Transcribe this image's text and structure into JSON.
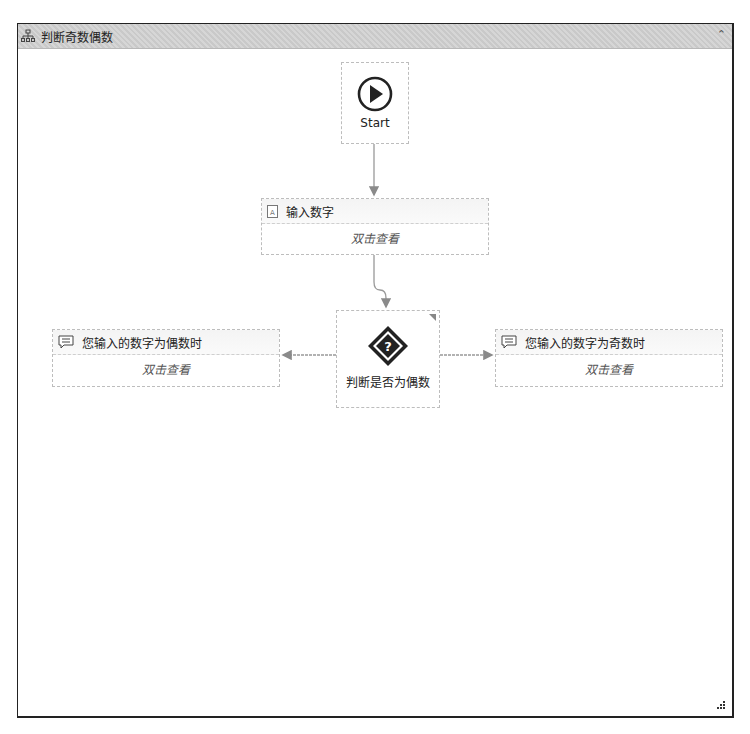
{
  "workflow": {
    "title": "判断奇数偶数",
    "collapse_icon": "double-chevron-up-icon"
  },
  "nodes": {
    "start": {
      "label": "Start",
      "icon": "play-circle-icon"
    },
    "input": {
      "title": "输入数字",
      "body": "双击查看",
      "icon": "input-dialog-icon"
    },
    "decision": {
      "label": "判断是否为偶数",
      "icon": "question-diamond-icon"
    },
    "even": {
      "title": "您输入的数字为偶数时",
      "body": "双击查看",
      "icon": "message-icon"
    },
    "odd": {
      "title": "您输入的数字为奇数时",
      "body": "双击查看",
      "icon": "message-icon"
    }
  },
  "colors": {
    "titlebar": "#cfcfcf",
    "connector": "#999999",
    "node_border": "#bdbdbd"
  }
}
